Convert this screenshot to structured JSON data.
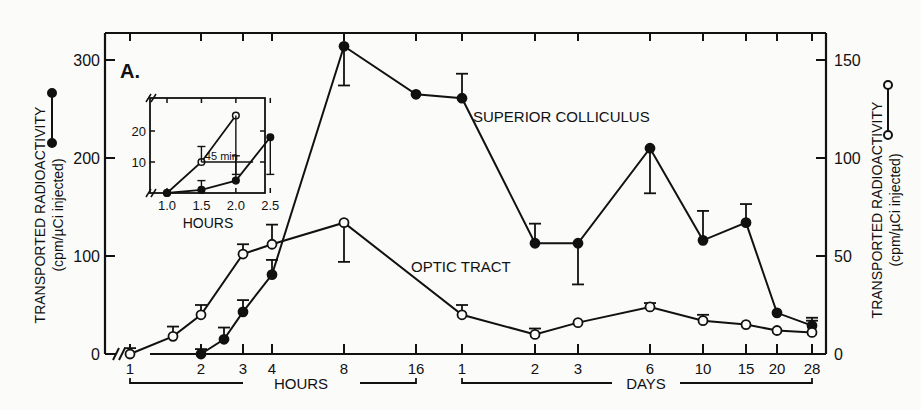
{
  "chart_data": {
    "type": "line",
    "panel_label": "A.",
    "left_axis": {
      "label_line1": "TRANSPORTED RADIOACTIVITY",
      "label_line2": "(cpm/µCi injected)",
      "series_marker": "filled",
      "ticks": [
        0,
        100,
        200,
        300
      ],
      "ylim": [
        0,
        330
      ]
    },
    "right_axis": {
      "label_line1": "TRANSPORTED RADIOACTIVITY",
      "label_line2": "(cpm/µCi injected)",
      "series_marker": "open",
      "ticks": [
        0,
        50,
        100,
        150
      ],
      "ylim": [
        0,
        165
      ]
    },
    "x_axis": {
      "scale": "log (segmented)",
      "groups": [
        {
          "label": "HOURS",
          "ticks": [
            "1",
            "2",
            "3",
            "4",
            "8",
            "16"
          ]
        },
        {
          "label": "DAYS",
          "ticks": [
            "1",
            "2",
            "3",
            "6",
            "10",
            "15",
            "20",
            "28"
          ]
        }
      ]
    },
    "series": [
      {
        "name": "SUPERIOR COLLICULUS",
        "marker": "filled circle",
        "axis": "left",
        "points": [
          {
            "x": "2 h",
            "y": 0,
            "err": 5
          },
          {
            "x": "2.5 h",
            "y": 15,
            "err": 12
          },
          {
            "x": "3 h",
            "y": 43,
            "err": 12
          },
          {
            "x": "4 h",
            "y": 81,
            "err": 15
          },
          {
            "x": "8 h",
            "y": 314,
            "err": 40
          },
          {
            "x": "16 h",
            "y": 265,
            "err": 0
          },
          {
            "x": "1 d",
            "y": 261,
            "err": 25
          },
          {
            "x": "2 d",
            "y": 113,
            "err": 20
          },
          {
            "x": "3 d",
            "y": 113,
            "err": 42
          },
          {
            "x": "6 d",
            "y": 210,
            "err": 46
          },
          {
            "x": "10 d",
            "y": 116,
            "err": 30
          },
          {
            "x": "15 d",
            "y": 134,
            "err": 19
          },
          {
            "x": "20 d",
            "y": 42,
            "err": 0
          },
          {
            "x": "28 d",
            "y": 29,
            "err": 8
          }
        ]
      },
      {
        "name": "OPTIC TRACT",
        "marker": "open circle",
        "axis": "right",
        "points": [
          {
            "x": "1 h",
            "y": 0,
            "err": 3
          },
          {
            "x": "1.5 h",
            "y": 9,
            "err": 5
          },
          {
            "x": "2 h",
            "y": 20,
            "err": 5
          },
          {
            "x": "3 h",
            "y": 51,
            "err": 5
          },
          {
            "x": "4 h",
            "y": 56,
            "err": 10
          },
          {
            "x": "8 h",
            "y": 67,
            "err": 20
          },
          {
            "x": "1 d",
            "y": 20,
            "err": 5
          },
          {
            "x": "2 d",
            "y": 10,
            "err": 3
          },
          {
            "x": "3 d",
            "y": 16,
            "err": 0
          },
          {
            "x": "6 d",
            "y": 24,
            "err": 2
          },
          {
            "x": "10 d",
            "y": 17,
            "err": 3
          },
          {
            "x": "15 d",
            "y": 15,
            "err": 0
          },
          {
            "x": "20 d",
            "y": 12,
            "err": 0
          },
          {
            "x": "28 d",
            "y": 11,
            "err": 6
          }
        ]
      }
    ],
    "inset": {
      "xlabel": "HOURS",
      "x_ticks": [
        "1.0",
        "1.5",
        "2.0",
        "2.5"
      ],
      "y_ticks": [
        "10",
        "20"
      ],
      "annotation": "45 min",
      "series": [
        {
          "name": "OPTIC TRACT",
          "marker": "open circle",
          "x": [
            1.0,
            1.5,
            2.0
          ],
          "y": [
            0,
            10,
            25
          ]
        },
        {
          "name": "SUPERIOR COLLICULUS",
          "marker": "filled circle",
          "x": [
            1.0,
            1.5,
            2.0,
            2.5
          ],
          "y": [
            0,
            1,
            4,
            18
          ]
        }
      ]
    },
    "grid": false,
    "legend": "series labels placed inline on plot; axis labels show marker keys"
  },
  "labels": {
    "panel": "A.",
    "sc": "SUPERIOR COLLICULUS",
    "ot": "OPTIC TRACT",
    "hours": "HOURS",
    "days": "DAYS",
    "inset_hours": "HOURS",
    "inset_note": "45 min",
    "yl1": "TRANSPORTED RADIOACTIVITY",
    "yl2": "(cpm/µCi injected)",
    "yr1": "TRANSPORTED RADIOACTIVITY",
    "yr2": "(cpm/µCi injected)"
  }
}
